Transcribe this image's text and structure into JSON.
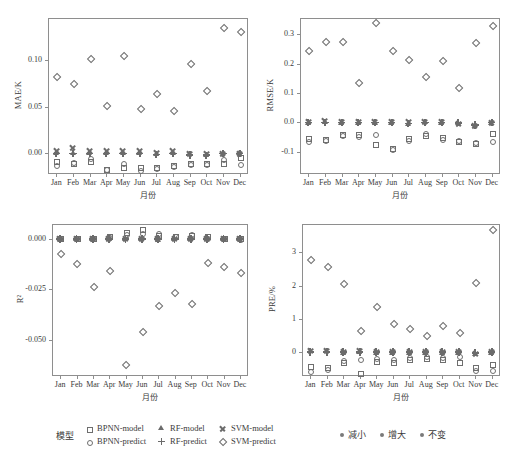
{
  "figure": {
    "months": [
      "Jan",
      "Feb",
      "Mar",
      "Apr",
      "May",
      "Jun",
      "Jul",
      "Aug",
      "Sep",
      "Oct",
      "Nov",
      "Dec"
    ],
    "xlabel": "月份"
  },
  "series_meta": [
    {
      "key": "BPNN-model",
      "label": "BPNN-model",
      "marker": "open-square",
      "marker_class": "m-sq",
      "icon": "open-square-icon"
    },
    {
      "key": "RF-model",
      "label": "RF-model",
      "marker": "filled-triangle",
      "marker_class": "m-tr",
      "icon": "filled-triangle-icon"
    },
    {
      "key": "SVM-model",
      "label": "SVM-model",
      "marker": "cross-x",
      "marker_class": "m-x",
      "icon": "cross-x-icon"
    },
    {
      "key": "BPNN-predict",
      "label": "BPNN-predict",
      "marker": "open-circle",
      "marker_class": "m-ci",
      "icon": "open-circle-icon"
    },
    {
      "key": "RF-predict",
      "label": "RF-predict",
      "marker": "plus",
      "marker_class": "m-pl",
      "icon": "plus-icon"
    },
    {
      "key": "SVM-predict",
      "label": "SVM-predict",
      "marker": "open-diamond",
      "marker_class": "m-di",
      "icon": "open-diamond-icon"
    }
  ],
  "legend": {
    "title": "模型",
    "items": [
      {
        "label": "BPNN-model",
        "marker_class": "m-sq",
        "icon": "open-square-icon"
      },
      {
        "label": "RF-model",
        "marker_class": "m-tr",
        "icon": "filled-triangle-icon"
      },
      {
        "label": "SVM-model",
        "marker_class": "m-x",
        "icon": "cross-x-icon"
      },
      {
        "label": "BPNN-predict",
        "marker_class": "m-ci",
        "icon": "open-circle-icon"
      },
      {
        "label": "RF-predict",
        "marker_class": "m-pl",
        "icon": "plus-icon"
      },
      {
        "label": "SVM-predict",
        "marker_class": "m-di",
        "icon": "open-diamond-icon"
      }
    ],
    "trend_items": [
      {
        "label": "减小",
        "color": "#7a7a7a"
      },
      {
        "label": "增大",
        "color": "#7a7a7a"
      },
      {
        "label": "不变",
        "color": "#7a7a7a"
      }
    ]
  },
  "colors": {
    "marker": "#6e6e6e",
    "axis": "#8e8e8e",
    "text": "#3a3a3a",
    "background": "#ffffff"
  },
  "chart_data": [
    {
      "id": "mae",
      "type": "scatter",
      "title": "",
      "xlabel": "月份",
      "ylabel": "MAE/K",
      "categories": [
        "Jan",
        "Feb",
        "Mar",
        "Apr",
        "May",
        "Jun",
        "Jul",
        "Aug",
        "Sep",
        "Oct",
        "Nov",
        "Dec"
      ],
      "yticks": [
        0.0,
        0.05,
        0.1
      ],
      "ytick_labels": [
        "0.00",
        "0.05",
        "0.10"
      ],
      "ylim": [
        -0.022,
        0.145
      ],
      "grid": false,
      "legend_position": "below-figure",
      "series": [
        {
          "name": "BPNN-model",
          "marker": "open-square",
          "values": [
            -0.008,
            -0.0098,
            -0.0078,
            -0.0165,
            -0.0143,
            -0.0148,
            -0.0143,
            -0.012,
            -0.0107,
            -0.0105,
            -0.0105,
            -0.0037
          ]
        },
        {
          "name": "RF-model",
          "marker": "filled-triangle",
          "values": [
            0.0002,
            0.0003,
            0.0002,
            0.0002,
            0.0003,
            0.0003,
            -0.0006,
            0.0008,
            -0.0012,
            -0.0014,
            0.0,
            0.0
          ]
        },
        {
          "name": "SVM-model",
          "marker": "cross-x",
          "values": [
            0.0031,
            0.0059,
            0.003,
            0.0031,
            0.0032,
            0.0028,
            0.0005,
            0.0029,
            0.0,
            0.0001,
            0.0,
            0.0
          ]
        },
        {
          "name": "BPNN-predict",
          "marker": "open-circle",
          "values": [
            -0.0122,
            -0.0096,
            -0.0045,
            -0.017,
            -0.0098,
            -0.018,
            -0.016,
            -0.013,
            -0.0113,
            -0.011,
            -0.006,
            -0.0112
          ]
        },
        {
          "name": "RF-predict",
          "marker": "plus",
          "values": [
            0.0,
            0.0,
            0.0,
            0.0,
            0.0,
            0.0,
            -0.001,
            0.0,
            -0.0018,
            -0.002,
            0.0,
            -0.0002
          ]
        },
        {
          "name": "SVM-predict",
          "marker": "open-diamond",
          "values": [
            0.083,
            0.075,
            0.102,
            0.0515,
            0.1055,
            0.0488,
            0.065,
            0.0462,
            0.0965,
            0.0678,
            0.1355,
            0.1305
          ]
        }
      ]
    },
    {
      "id": "rmse",
      "type": "scatter",
      "title": "",
      "xlabel": "月份",
      "ylabel": "RMSE/K",
      "categories": [
        "Jan",
        "Feb",
        "Mar",
        "Apr",
        "May",
        "Jun",
        "Jul",
        "Aug",
        "Sep",
        "Oct",
        "Nov",
        "Dec"
      ],
      "yticks": [
        -0.1,
        0.0,
        0.1,
        0.2,
        0.3
      ],
      "ytick_labels": [
        "-0.1",
        "0.0",
        "0.1",
        "0.2",
        "0.3"
      ],
      "ylim": [
        -0.175,
        0.355
      ],
      "grid": false,
      "legend_position": "below-figure",
      "series": [
        {
          "name": "BPNN-model",
          "marker": "open-square",
          "values": [
            -0.052,
            -0.055,
            -0.04,
            -0.038,
            -0.072,
            -0.088,
            -0.054,
            -0.042,
            -0.05,
            -0.062,
            -0.068,
            -0.036
          ]
        },
        {
          "name": "RF-model",
          "marker": "filled-triangle",
          "values": [
            -0.004,
            0.0,
            -0.002,
            -0.002,
            -0.001,
            -0.001,
            -0.005,
            0.0,
            -0.002,
            -0.003,
            -0.01,
            -0.002
          ]
        },
        {
          "name": "SVM-model",
          "marker": "cross-x",
          "values": [
            0.004,
            0.006,
            0.004,
            0.004,
            0.004,
            0.004,
            0.004,
            0.004,
            0.002,
            -0.004,
            -0.012,
            0.0
          ]
        },
        {
          "name": "BPNN-predict",
          "marker": "open-circle",
          "values": [
            -0.062,
            -0.058,
            -0.043,
            -0.046,
            -0.04,
            -0.09,
            -0.058,
            -0.036,
            -0.056,
            -0.06,
            -0.066,
            -0.062
          ]
        },
        {
          "name": "RF-predict",
          "marker": "plus",
          "values": [
            0.0,
            0.0,
            0.0,
            0.0,
            0.0,
            0.0,
            -0.003,
            0.0,
            0.0,
            -0.001,
            -0.008,
            0.0
          ]
        },
        {
          "name": "SVM-predict",
          "marker": "open-diamond",
          "values": [
            0.246,
            0.275,
            0.278,
            0.137,
            0.34,
            0.246,
            0.215,
            0.157,
            0.212,
            0.121,
            0.272,
            0.33
          ]
        }
      ]
    },
    {
      "id": "r2",
      "type": "scatter",
      "title": "",
      "xlabel": "月份",
      "ylabel": "R²",
      "categories": [
        "Jan",
        "Feb",
        "Mar",
        "Apr",
        "May",
        "Jun",
        "Jul",
        "Aug",
        "Sep",
        "Oct",
        "Nov",
        "Dec"
      ],
      "yticks": [
        -0.05,
        -0.025,
        0.0
      ],
      "ytick_labels": [
        "-0.050",
        "-0.025",
        "0.000"
      ],
      "ylim": [
        -0.068,
        0.0075
      ],
      "grid": false,
      "legend_position": "below-figure",
      "series": [
        {
          "name": "BPNN-model",
          "marker": "open-square",
          "values": [
            0.0006,
            0.0006,
            0.0006,
            0.0015,
            0.0035,
            0.005,
            0.0022,
            0.0014,
            0.002,
            0.0013,
            0.0005,
            0.0005
          ]
        },
        {
          "name": "RF-model",
          "marker": "filled-triangle",
          "values": [
            -0.0002,
            -0.0002,
            -0.0002,
            -0.0002,
            -0.0002,
            -0.0002,
            -0.0003,
            -0.0002,
            -0.0002,
            -0.0002,
            -0.0002,
            -0.0002
          ]
        },
        {
          "name": "SVM-model",
          "marker": "cross-x",
          "values": [
            0.0,
            0.0,
            0.0,
            0.0,
            0.0,
            0.0,
            0.0,
            0.0,
            0.0,
            0.0,
            0.0,
            0.0
          ]
        },
        {
          "name": "BPNN-predict",
          "marker": "open-circle",
          "values": [
            0.0004,
            0.0004,
            0.0004,
            0.0008,
            0.0025,
            0.003,
            0.0028,
            0.0017,
            0.0027,
            0.0005,
            0.0004,
            0.0002
          ]
        },
        {
          "name": "RF-predict",
          "marker": "plus",
          "values": [
            0.0,
            0.0,
            0.0,
            0.0,
            0.0,
            0.0,
            0.0,
            0.0,
            0.0,
            0.0,
            0.0,
            0.0
          ]
        },
        {
          "name": "SVM-predict",
          "marker": "open-diamond",
          "values": [
            -0.007,
            -0.012,
            -0.0232,
            -0.0155,
            -0.062,
            -0.0455,
            -0.033,
            -0.0265,
            -0.032,
            -0.0115,
            -0.0135,
            -0.0165
          ]
        }
      ]
    },
    {
      "id": "pre",
      "type": "scatter",
      "title": "",
      "xlabel": "月份",
      "ylabel": "PRE/%",
      "categories": [
        "Jan",
        "Feb",
        "Mar",
        "Apr",
        "May",
        "Jun",
        "Jul",
        "Aug",
        "Sep",
        "Oct",
        "Nov",
        "Dec"
      ],
      "yticks": [
        0,
        1,
        2,
        3
      ],
      "ytick_labels": [
        "0",
        "1",
        "2",
        "3"
      ],
      "ylim": [
        -0.72,
        3.85
      ],
      "grid": false,
      "legend_position": "below-figure",
      "series": [
        {
          "name": "BPNN-model",
          "marker": "open-square",
          "values": [
            -0.42,
            -0.45,
            -0.3,
            -0.62,
            -0.28,
            -0.3,
            -0.2,
            -0.17,
            -0.2,
            -0.31,
            -0.46,
            -0.36
          ]
        },
        {
          "name": "RF-model",
          "marker": "filled-triangle",
          "values": [
            0.02,
            0.03,
            -0.02,
            0.0,
            -0.03,
            -0.02,
            -0.03,
            -0.02,
            -0.03,
            -0.03,
            -0.05,
            -0.03
          ]
        },
        {
          "name": "SVM-model",
          "marker": "cross-x",
          "values": [
            0.04,
            0.05,
            0.02,
            0.04,
            0.01,
            0.01,
            0.0,
            0.0,
            0.0,
            0.0,
            -0.06,
            0.0
          ]
        },
        {
          "name": "BPNN-predict",
          "marker": "open-circle",
          "values": [
            -0.58,
            -0.52,
            -0.24,
            -0.22,
            -0.18,
            -0.2,
            -0.14,
            -0.12,
            -0.14,
            -0.12,
            -0.53,
            -0.55
          ]
        },
        {
          "name": "RF-predict",
          "marker": "plus",
          "values": [
            0.0,
            0.0,
            0.0,
            0.0,
            0.0,
            0.0,
            0.0,
            0.0,
            0.0,
            0.0,
            -0.02,
            0.0
          ]
        },
        {
          "name": "SVM-predict",
          "marker": "open-diamond",
          "values": [
            2.78,
            2.58,
            2.07,
            0.66,
            1.38,
            0.87,
            0.73,
            0.52,
            0.81,
            0.6,
            2.1,
            3.7
          ]
        }
      ]
    }
  ]
}
